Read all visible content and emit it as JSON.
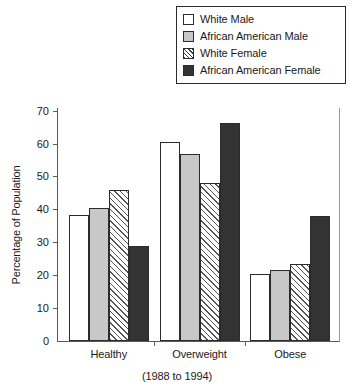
{
  "chart_data": {
    "type": "bar",
    "title": "",
    "subtitle": "(1988 to 1994)",
    "xlabel": "",
    "ylabel": "Percentage of Population",
    "categories": [
      "Healthy",
      "Overweight",
      "Obese"
    ],
    "series": [
      {
        "name": "White Male",
        "values": [
          38.5,
          60.5,
          20.5
        ],
        "color": "#ffffff",
        "pattern": "solid"
      },
      {
        "name": "African American Male",
        "values": [
          40.5,
          57.0,
          21.5
        ],
        "color": "#c8c8c8",
        "pattern": "solid"
      },
      {
        "name": "White Female",
        "values": [
          46.0,
          48.0,
          23.5
        ],
        "color": "#ffffff",
        "pattern": "diagonal-hatch"
      },
      {
        "name": "African American Female",
        "values": [
          29.0,
          66.5,
          38.0
        ],
        "color": "#333333",
        "pattern": "solid"
      }
    ],
    "ylim": [
      0,
      70
    ],
    "yticks": [
      0,
      10,
      20,
      30,
      40,
      50,
      60,
      70
    ],
    "ytick_labels": [
      "0",
      "10",
      "20",
      "30",
      "40",
      "50",
      "60",
      "70"
    ],
    "grid": false,
    "legend_position": "top-right"
  },
  "legend": {
    "items": [
      {
        "label": "White Male"
      },
      {
        "label": "African American Male"
      },
      {
        "label": "White Female"
      },
      {
        "label": "African American Female"
      }
    ]
  }
}
